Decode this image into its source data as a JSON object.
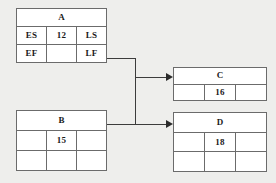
{
  "diagram": {
    "type": "activity-on-node network diagram",
    "background_color": "#eeeeec",
    "box_fill_color": "#ffffff",
    "line_color": "#3c3c3c",
    "nodes": [
      {
        "id": "A",
        "title": "A",
        "rows": [
          [
            "ES",
            "12",
            "LS"
          ],
          [
            "EF",
            "",
            "LF"
          ]
        ]
      },
      {
        "id": "B",
        "title": "B",
        "rows": [
          [
            "",
            "15",
            ""
          ],
          [
            "",
            "",
            ""
          ]
        ]
      },
      {
        "id": "C",
        "title": "C",
        "rows": [
          [
            "",
            "16",
            ""
          ]
        ]
      },
      {
        "id": "D",
        "title": "D",
        "rows": [
          [
            "",
            "18",
            ""
          ],
          [
            "",
            "",
            ""
          ]
        ]
      }
    ],
    "edges": [
      {
        "from": "A",
        "to": "C",
        "label": ""
      },
      {
        "from": "A",
        "to": "D",
        "label": ""
      },
      {
        "from": "B",
        "to": "C",
        "label": ""
      },
      {
        "from": "B",
        "to": "D",
        "label": ""
      }
    ]
  }
}
